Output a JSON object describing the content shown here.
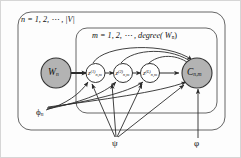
{
  "figure": {
    "type": "plate-notation-graphical-model",
    "background": "#fdfdfd",
    "border_color": "#cfcfcf",
    "stroke_color": "#333333",
    "shaded_node_fill": "#b3b3b3",
    "open_node_fill": "#ffffff"
  },
  "plates": [
    {
      "id": "outer-plate",
      "label_prefix": "n",
      "label": "n = 1, 2, ⋯ , |V|",
      "label_parts": {
        "index": "n",
        "equals": "=",
        "values": "1, 2, ⋯ ,",
        "bound": "|V|"
      }
    },
    {
      "id": "inner-plate",
      "label_prefix": "m",
      "label": "m = 1, 2, ⋯ , degree( W",
      "label_parts": {
        "index": "m",
        "equals": "=",
        "values": "1, 2, ⋯ ,",
        "func": "degree(",
        "arg": "W",
        "arg_sub": "n",
        "close": ")"
      }
    }
  ],
  "nodes": [
    {
      "id": "W",
      "label": "W",
      "sub": "n",
      "sup": "",
      "shaded": true,
      "kind": "observed"
    },
    {
      "id": "z1",
      "label": "z",
      "sub": "n,m",
      "sup": "(1)",
      "shaded": false,
      "kind": "latent"
    },
    {
      "id": "z2",
      "label": "z",
      "sub": "n,m",
      "sup": "(2)",
      "shaded": false,
      "kind": "latent"
    },
    {
      "id": "zL",
      "label": "z",
      "sub": "n,m",
      "sup": "(L)",
      "shaded": false,
      "kind": "latent"
    },
    {
      "id": "C",
      "label": "C",
      "sub": "n,m",
      "sup": "",
      "shaded": true,
      "kind": "observed"
    }
  ],
  "parameters": [
    {
      "id": "phi_n",
      "label": "ϕ",
      "sub": "n",
      "position": "bottom-left"
    },
    {
      "id": "psi",
      "label": "ψ",
      "sub": "",
      "position": "bottom-center"
    },
    {
      "id": "varphi",
      "label": "φ",
      "sub": "",
      "position": "bottom-right"
    }
  ],
  "edges": [
    {
      "from": "W",
      "to": "z1",
      "style": "thick-straight"
    },
    {
      "from": "z1",
      "to": "z2",
      "style": "straight"
    },
    {
      "from": "z2",
      "to": "zL",
      "style": "straight"
    },
    {
      "from": "zL",
      "to": "C",
      "style": "straight"
    },
    {
      "from": "z1",
      "to": "C",
      "style": "curved-arc"
    },
    {
      "from": "z2",
      "to": "C",
      "style": "curved-arc"
    },
    {
      "from": "zL",
      "to": "C",
      "style": "curved-arc"
    },
    {
      "from": "phi_n",
      "to": "z1",
      "style": "straight"
    },
    {
      "from": "phi_n",
      "to": "z2",
      "style": "straight"
    },
    {
      "from": "phi_n",
      "to": "zL",
      "style": "straight"
    },
    {
      "from": "phi_n",
      "to": "C",
      "style": "straight"
    },
    {
      "from": "psi",
      "to": "z1",
      "style": "straight"
    },
    {
      "from": "psi",
      "to": "z2",
      "style": "straight"
    },
    {
      "from": "psi",
      "to": "zL",
      "style": "straight"
    },
    {
      "from": "psi",
      "to": "C",
      "style": "straight"
    },
    {
      "from": "varphi",
      "to": "C",
      "style": "straight-vertical"
    }
  ]
}
